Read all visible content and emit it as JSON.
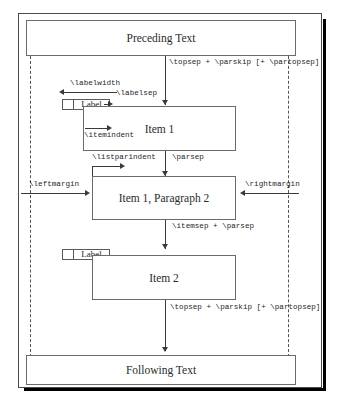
{
  "figure": {
    "colors": {
      "box_border": "#6b6b6b",
      "frame_border": "#4a4a4a",
      "rule": "#3a3a3a",
      "dashed_guide": "#555555",
      "text": "#2b2b2b",
      "background": "#ffffff",
      "shadow": "#000000"
    }
  },
  "blocks": {
    "preceding_text": "Preceding Text",
    "item1": "Item 1",
    "item1_paragraph2": "Item 1, Paragraph 2",
    "item2": "Item 2",
    "following_text": "Following Text",
    "label_item1": "Label",
    "label_item2": "Label"
  },
  "annotations": {
    "topsep_top": "\\topsep + \\parskip [+ \\partopsep]",
    "labelwidth": "\\labelwidth",
    "labelsep": "\\labelsep",
    "itemindent": "\\itemindent",
    "listparindent": "\\listparindent",
    "parsep": "\\parsep",
    "leftmargin": "\\leftmargin",
    "rightmargin": "\\rightmargin",
    "itemsep_parsep": "\\itemsep + \\parsep",
    "topsep_bottom": "\\topsep + \\parskip [+ \\partopsep]"
  }
}
